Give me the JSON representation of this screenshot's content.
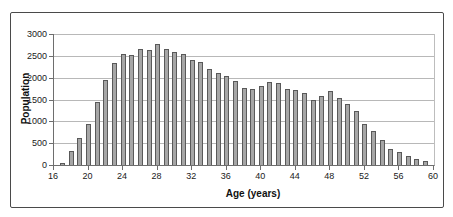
{
  "figure": {
    "background": "#ffffff",
    "frame_border_color": "#4a4a4a"
  },
  "chart_data": {
    "type": "bar",
    "title": "",
    "xlabel": "Age (years)",
    "ylabel": "Population",
    "xlim": [
      16,
      60
    ],
    "ylim": [
      0,
      3000
    ],
    "x_ticks": [
      16,
      20,
      24,
      28,
      32,
      36,
      40,
      44,
      48,
      52,
      56,
      60
    ],
    "y_ticks": [
      0,
      500,
      1000,
      1500,
      2000,
      2500,
      3000
    ],
    "grid": "horizontal",
    "legend": "none",
    "bar_color": "#a6a6a6",
    "bar_border_color": "#595959",
    "gridline_color": "#b8b8b8",
    "x": [
      17,
      18,
      19,
      20,
      21,
      22,
      23,
      24,
      25,
      26,
      27,
      28,
      29,
      30,
      31,
      32,
      33,
      34,
      35,
      36,
      37,
      38,
      39,
      40,
      41,
      42,
      43,
      44,
      45,
      46,
      47,
      48,
      49,
      50,
      51,
      52,
      53,
      54,
      55,
      56,
      57,
      58,
      59
    ],
    "values": [
      50,
      320,
      620,
      950,
      1450,
      1950,
      2330,
      2550,
      2520,
      2650,
      2640,
      2780,
      2660,
      2580,
      2540,
      2400,
      2350,
      2190,
      2110,
      2030,
      1930,
      1760,
      1750,
      1800,
      1900,
      1870,
      1730,
      1710,
      1660,
      1490,
      1590,
      1690,
      1540,
      1390,
      1230,
      950,
      780,
      570,
      370,
      290,
      210,
      130,
      90
    ]
  }
}
